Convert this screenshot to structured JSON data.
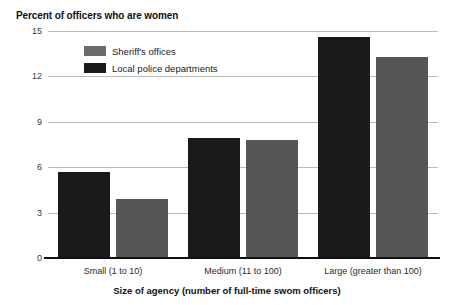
{
  "chart_data": {
    "type": "bar",
    "title": "Percent of officers who are women",
    "xlabel": "Size of agency (number of full-time swom officers)",
    "ylabel": "",
    "ylim": [
      0,
      15
    ],
    "yticks": [
      0,
      3,
      6,
      9,
      12,
      15
    ],
    "ytick_labels": [
      "0",
      "3",
      "6",
      "9",
      "12",
      "15"
    ],
    "grid": true,
    "legend_position": "upper-left-inside",
    "categories": [
      "Small (1 to 10)",
      "Medium (11 to 100)",
      "Large (greater than 100)"
    ],
    "series": [
      {
        "name": "Local police departments",
        "color": "#1a1a1a",
        "values": [
          5.7,
          7.9,
          14.6
        ]
      },
      {
        "name": "Sheriff's offices",
        "color": "#565656",
        "values": [
          3.9,
          7.8,
          13.3
        ]
      }
    ],
    "legend_order": [
      "Sheriff's offices",
      "Local police departments"
    ]
  }
}
